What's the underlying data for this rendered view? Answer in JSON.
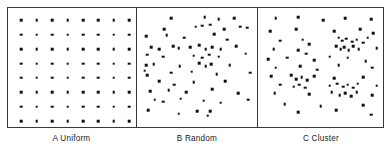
{
  "figure": {
    "panel_count": 3
  },
  "panels": [
    {
      "id": "A",
      "label": "A Uniform",
      "pattern": "uniform"
    },
    {
      "id": "B",
      "label": "B Random",
      "pattern": "random"
    },
    {
      "id": "C",
      "label": "C Cluster",
      "pattern": "cluster"
    }
  ],
  "chart_data": {
    "type": "scatter",
    "xlabel": "",
    "ylabel": "",
    "xlim": [
      0,
      100
    ],
    "ylim": [
      0,
      100
    ],
    "grid": false,
    "legend_position": "none",
    "marker": {
      "shape": "square",
      "color": "#111111",
      "size_px": 2.6
    },
    "panels": [
      {
        "id": "A",
        "label": "A Uniform",
        "description": "Regular 8 by 8 lattice of evenly spaced points",
        "n_points": 64,
        "points": [
          [
            6,
            6
          ],
          [
            19.4,
            6
          ],
          [
            32.9,
            6
          ],
          [
            46.3,
            6
          ],
          [
            59.7,
            6
          ],
          [
            73.1,
            6
          ],
          [
            86.6,
            6
          ],
          [
            100,
            6
          ],
          [
            6,
            19.4
          ],
          [
            19.4,
            19.4
          ],
          [
            32.9,
            19.4
          ],
          [
            46.3,
            19.4
          ],
          [
            59.7,
            19.4
          ],
          [
            73.1,
            19.4
          ],
          [
            86.6,
            19.4
          ],
          [
            100,
            19.4
          ],
          [
            6,
            32.9
          ],
          [
            19.4,
            32.9
          ],
          [
            32.9,
            32.9
          ],
          [
            46.3,
            32.9
          ],
          [
            59.7,
            32.9
          ],
          [
            73.1,
            32.9
          ],
          [
            86.6,
            32.9
          ],
          [
            100,
            32.9
          ],
          [
            6,
            46.3
          ],
          [
            19.4,
            46.3
          ],
          [
            32.9,
            46.3
          ],
          [
            46.3,
            46.3
          ],
          [
            59.7,
            46.3
          ],
          [
            73.1,
            46.3
          ],
          [
            86.6,
            46.3
          ],
          [
            100,
            46.3
          ],
          [
            6,
            59.7
          ],
          [
            19.4,
            59.7
          ],
          [
            32.9,
            59.7
          ],
          [
            46.3,
            59.7
          ],
          [
            59.7,
            59.7
          ],
          [
            73.1,
            59.7
          ],
          [
            86.6,
            59.7
          ],
          [
            100,
            59.7
          ],
          [
            6,
            73.1
          ],
          [
            19.4,
            73.1
          ],
          [
            32.9,
            73.1
          ],
          [
            46.3,
            73.1
          ],
          [
            59.7,
            73.1
          ],
          [
            73.1,
            73.1
          ],
          [
            86.6,
            73.1
          ],
          [
            100,
            73.1
          ],
          [
            6,
            86.6
          ],
          [
            19.4,
            86.6
          ],
          [
            32.9,
            86.6
          ],
          [
            46.3,
            86.6
          ],
          [
            59.7,
            86.6
          ],
          [
            73.1,
            86.6
          ],
          [
            86.6,
            86.6
          ],
          [
            100,
            86.6
          ],
          [
            6,
            100
          ],
          [
            19.4,
            100
          ],
          [
            32.9,
            100
          ],
          [
            46.3,
            100
          ],
          [
            59.7,
            100
          ],
          [
            73.1,
            100
          ],
          [
            86.6,
            100
          ],
          [
            100,
            100
          ]
        ]
      },
      {
        "id": "B",
        "label": "B Random",
        "description": "Randomly scattered points with no regular spacing",
        "n_points": 64,
        "points": [
          [
            26,
            4
          ],
          [
            57,
            3
          ],
          [
            70,
            5
          ],
          [
            84,
            4
          ],
          [
            20,
            14
          ],
          [
            49,
            12
          ],
          [
            55,
            11
          ],
          [
            62,
            10
          ],
          [
            75,
            14
          ],
          [
            90,
            12
          ],
          [
            96,
            13
          ],
          [
            3,
            21
          ],
          [
            22,
            20
          ],
          [
            38,
            22
          ],
          [
            66,
            19
          ],
          [
            78,
            24
          ],
          [
            8,
            31
          ],
          [
            15,
            33
          ],
          [
            28,
            30
          ],
          [
            33,
            32
          ],
          [
            44,
            31
          ],
          [
            52,
            29
          ],
          [
            58,
            33
          ],
          [
            64,
            31
          ],
          [
            72,
            33
          ],
          [
            86,
            30
          ],
          [
            4,
            38
          ],
          [
            19,
            40
          ],
          [
            47,
            39
          ],
          [
            55,
            41
          ],
          [
            61,
            38
          ],
          [
            70,
            40
          ],
          [
            95,
            37
          ],
          [
            3,
            48
          ],
          [
            10,
            47
          ],
          [
            34,
            49
          ],
          [
            52,
            46
          ],
          [
            58,
            49
          ],
          [
            63,
            47
          ],
          [
            80,
            48
          ],
          [
            2,
            53
          ],
          [
            4,
            57
          ],
          [
            26,
            55
          ],
          [
            45,
            54
          ],
          [
            68,
            56
          ],
          [
            99,
            55
          ],
          [
            15,
            63
          ],
          [
            29,
            66
          ],
          [
            47,
            64
          ],
          [
            76,
            63
          ],
          [
            7,
            72
          ],
          [
            24,
            71
          ],
          [
            40,
            73
          ],
          [
            64,
            70
          ],
          [
            88,
            74
          ],
          [
            11,
            80
          ],
          [
            19,
            82
          ],
          [
            35,
            79
          ],
          [
            56,
            81
          ],
          [
            72,
            83
          ],
          [
            97,
            80
          ],
          [
            5,
            90
          ],
          [
            33,
            93
          ],
          [
            50,
            91
          ],
          [
            60,
            95
          ],
          [
            62,
            91
          ]
        ]
      },
      {
        "id": "C",
        "label": "C Cluster",
        "description": "Points grouped into dense clusters separated by sparse areas",
        "n_points": 70,
        "points": [
          [
            10,
            4
          ],
          [
            30,
            3
          ],
          [
            52,
            6
          ],
          [
            72,
            4
          ],
          [
            95,
            5
          ],
          [
            5,
            16
          ],
          [
            28,
            14
          ],
          [
            62,
            16
          ],
          [
            85,
            14
          ],
          [
            97,
            18
          ],
          [
            14,
            25
          ],
          [
            34,
            24
          ],
          [
            40,
            28
          ],
          [
            66,
            22
          ],
          [
            69,
            25
          ],
          [
            73,
            23
          ],
          [
            78,
            26
          ],
          [
            82,
            24
          ],
          [
            88,
            27
          ],
          [
            92,
            22
          ],
          [
            8,
            33
          ],
          [
            30,
            34
          ],
          [
            37,
            37
          ],
          [
            64,
            30
          ],
          [
            68,
            33
          ],
          [
            71,
            31
          ],
          [
            75,
            34
          ],
          [
            79,
            30
          ],
          [
            84,
            33
          ],
          [
            100,
            32
          ],
          [
            3,
            42
          ],
          [
            20,
            41
          ],
          [
            44,
            43
          ],
          [
            58,
            40
          ],
          [
            74,
            41
          ],
          [
            90,
            44
          ],
          [
            10,
            50
          ],
          [
            32,
            49
          ],
          [
            47,
            52
          ],
          [
            66,
            48
          ],
          [
            96,
            50
          ],
          [
            6,
            58
          ],
          [
            24,
            57
          ],
          [
            28,
            61
          ],
          [
            33,
            59
          ],
          [
            38,
            62
          ],
          [
            44,
            58
          ],
          [
            62,
            60
          ],
          [
            88,
            59
          ],
          [
            14,
            66
          ],
          [
            26,
            68
          ],
          [
            31,
            66
          ],
          [
            36,
            69
          ],
          [
            58,
            67
          ],
          [
            65,
            65
          ],
          [
            70,
            68
          ],
          [
            74,
            66
          ],
          [
            79,
            69
          ],
          [
            83,
            65
          ],
          [
            100,
            67
          ],
          [
            9,
            74
          ],
          [
            40,
            75
          ],
          [
            60,
            73
          ],
          [
            67,
            76
          ],
          [
            72,
            74
          ],
          [
            77,
            77
          ],
          [
            82,
            73
          ],
          [
            96,
            76
          ],
          [
            18,
            84
          ],
          [
            50,
            86
          ],
          [
            88,
            85
          ],
          [
            30,
            92
          ],
          [
            64,
            90
          ],
          [
            95,
            94
          ]
        ]
      }
    ]
  }
}
